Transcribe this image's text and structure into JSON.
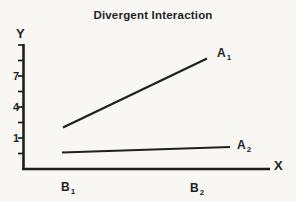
{
  "palette": {
    "ink": "#1f1f1f",
    "paper": "#f8f7f4"
  },
  "chart_data": {
    "type": "line",
    "title": "Divergent Interaction",
    "xlabel": "X",
    "ylabel": "Y",
    "x_categories": [
      {
        "base": "B",
        "sub": "1"
      },
      {
        "base": "B",
        "sub": "2"
      }
    ],
    "y_tick_labels": [
      "7",
      "4",
      "1"
    ],
    "y_axis": {
      "tick_count": 8,
      "labeled_tick_indices": [
        2,
        4,
        6
      ]
    },
    "series": [
      {
        "name": "A1",
        "label": {
          "base": "A",
          "sub": "1"
        },
        "values_at_B1_B2": [
          2,
          8.5
        ]
      },
      {
        "name": "A2",
        "label": {
          "base": "A",
          "sub": "2"
        },
        "values_at_B1_B2": [
          0.5,
          0.8
        ]
      }
    ],
    "grid": false,
    "legend": "inline labels at right end of each line",
    "layout_px": {
      "y_axis": {
        "x": 23.5,
        "y1": 44,
        "y2": 170
      },
      "x_axis": {
        "y": 169,
        "x1": 22,
        "x2": 270
      },
      "ticks": {
        "x1": 18,
        "x2": 23.5,
        "ys": [
          45,
          60.5,
          76,
          91.5,
          107,
          122.5,
          138,
          153.5
        ]
      },
      "axis_stroke_width": 2.6,
      "tick_stroke_width": 1.7,
      "series_px": [
        {
          "x1": 63,
          "y1": 127.5,
          "x2": 207,
          "y2": 58.5,
          "stroke_width": 2.2
        },
        {
          "x1": 62,
          "y1": 152.5,
          "x2": 230,
          "y2": 147,
          "stroke_width": 1.9
        }
      ]
    }
  }
}
